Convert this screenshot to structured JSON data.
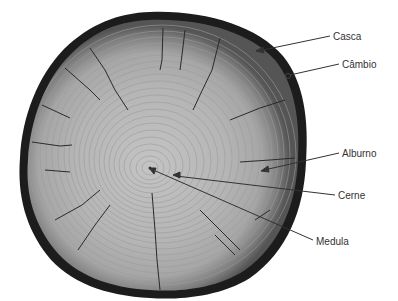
{
  "diagram": {
    "labels": [
      {
        "id": "casca",
        "text": "Casca",
        "x": 333,
        "y": 31
      },
      {
        "id": "cambio",
        "text": "Câmbio",
        "x": 342,
        "y": 59
      },
      {
        "id": "alburno",
        "text": "Alburno",
        "x": 342,
        "y": 148
      },
      {
        "id": "cerne",
        "text": "Cerne",
        "x": 338,
        "y": 190
      },
      {
        "id": "medula",
        "text": "Medula",
        "x": 316,
        "y": 236
      }
    ],
    "colors": {
      "bark": "#1a1a1a",
      "sapwood": "#8a8a8a",
      "heartwood": "#b8b8b8",
      "rings": "#9a9a9a",
      "leader": "#333333",
      "text": "#333333"
    }
  }
}
